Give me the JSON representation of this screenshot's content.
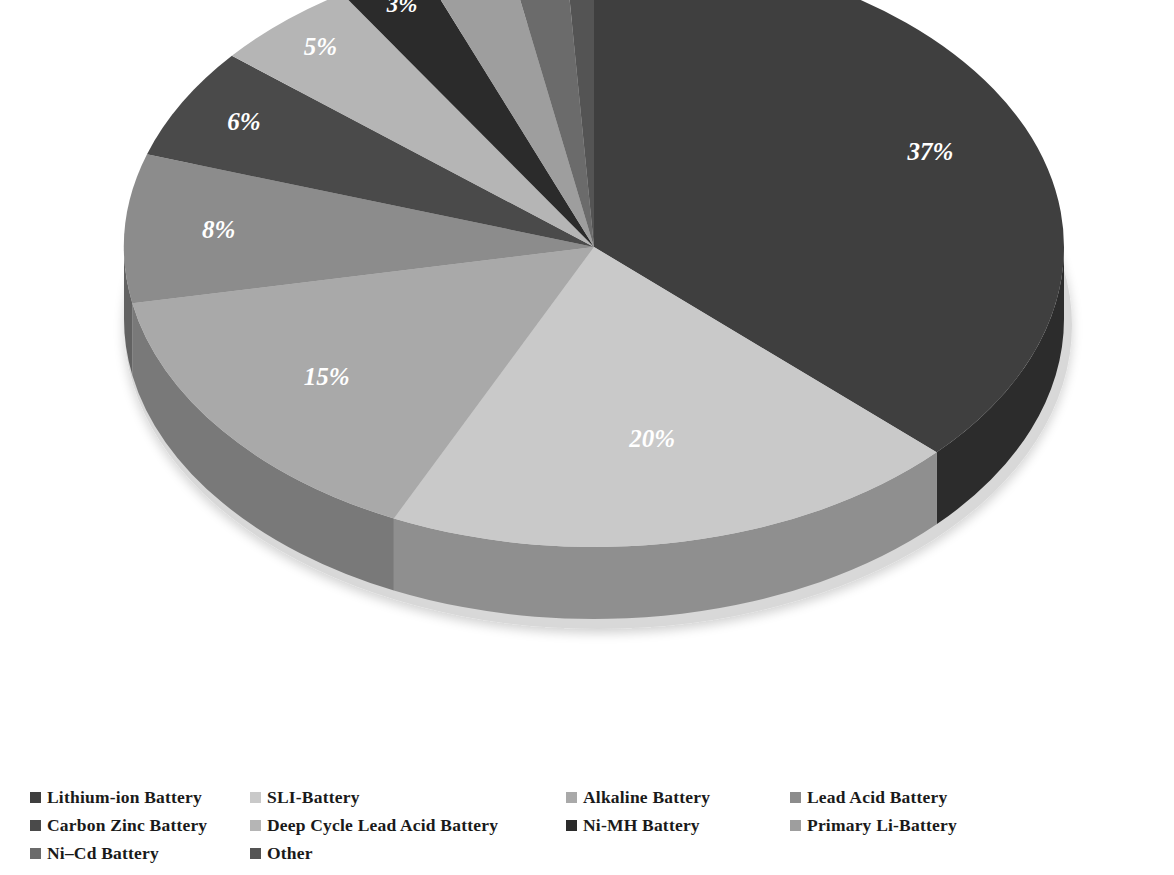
{
  "chart_data": {
    "type": "pie",
    "title": "",
    "three_d": true,
    "start_angle_deg": 0,
    "direction": "clockwise",
    "legend_position": "bottom",
    "categories": [
      "Lithium-ion Battery",
      "SLI-Battery",
      "Alkaline Battery",
      "Lead Acid Battery",
      "Carbon Zinc Battery",
      "Deep Cycle Lead Acid Battery",
      "Ni-MH Battery",
      "Primary Li-Battery",
      "Ni–Cd Battery",
      "Other"
    ],
    "values": [
      37,
      20,
      15,
      8,
      6,
      5,
      3,
      3,
      2,
      1
    ],
    "labels": [
      "37%",
      "20%",
      "15%",
      "8%",
      "6%",
      "5%",
      "3%",
      "3%",
      "2%",
      "1%"
    ],
    "colors": [
      "#3f3f3f",
      "#c9c9c9",
      "#a9a9a9",
      "#8c8c8c",
      "#4a4a4a",
      "#b5b5b5",
      "#2b2b2b",
      "#9e9e9e",
      "#6b6b6b",
      "#545454"
    ],
    "side_colors": [
      "#2c2c2c",
      "#8f8f8f",
      "#797979",
      "#626262",
      "#343434",
      "#808080",
      "#1e1e1e",
      "#707070",
      "#4b4b4b",
      "#3b3b3b"
    ],
    "label_color": "#ffffff"
  },
  "legend": {
    "rows": [
      [
        {
          "label": "Lithium-ion Battery",
          "color": "#3f3f3f",
          "x": 30
        },
        {
          "label": "SLI-Battery",
          "color": "#c9c9c9",
          "x": 250
        },
        {
          "label": "Alkaline Battery",
          "color": "#a9a9a9",
          "x": 566
        },
        {
          "label": "Lead Acid Battery",
          "color": "#8c8c8c",
          "x": 790
        }
      ],
      [
        {
          "label": "Carbon Zinc Battery",
          "color": "#4a4a4a",
          "x": 30
        },
        {
          "label": "Deep Cycle Lead Acid Battery",
          "color": "#b5b5b5",
          "x": 250
        },
        {
          "label": "Ni-MH Battery",
          "color": "#2b2b2b",
          "x": 566
        },
        {
          "label": "Primary Li-Battery",
          "color": "#9e9e9e",
          "x": 790
        }
      ],
      [
        {
          "label": "Ni–Cd Battery",
          "color": "#6b6b6b",
          "x": 30
        },
        {
          "label": "Other",
          "color": "#545454",
          "x": 250
        }
      ]
    ]
  },
  "geometry": {
    "cx": 594,
    "cy": 247,
    "rx": 470,
    "ry": 300,
    "depth": 72
  }
}
